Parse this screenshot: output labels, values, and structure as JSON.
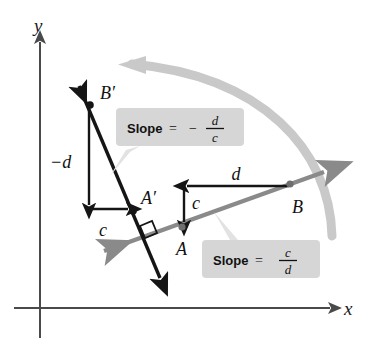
{
  "figure": {
    "background": "#ffffff"
  },
  "colors": {
    "axis": "#4a4a4a",
    "black_line": "#151515",
    "gray_line": "#8a8a8a",
    "rotation_arrow": "#c9c9c9",
    "callout_fill": "#d6d6d6",
    "callout_tail": "#e2e2e2",
    "text": "#111111"
  },
  "axes": {
    "x_label": "x",
    "y_label": "y",
    "origin": {
      "x": 40,
      "y": 308
    }
  },
  "lines": [
    {
      "name": "original-line",
      "color": "#8a8a8a",
      "slope_sign": "positive",
      "from": {
        "x": 100,
        "y": 253
      },
      "to": {
        "x": 327,
        "y": 171
      },
      "arrow_both_ends": true
    },
    {
      "name": "rotated-line",
      "color": "#151515",
      "slope_sign": "negative",
      "from": {
        "x": 77,
        "y": 80
      },
      "to": {
        "x": 162,
        "y": 283
      },
      "arrow_both_ends": true
    }
  ],
  "points": [
    {
      "name": "point-a",
      "label": "A",
      "x": 182,
      "y": 227,
      "label_x": 178,
      "label_y": 253
    },
    {
      "name": "point-b",
      "label": "B",
      "x": 290,
      "y": 184,
      "label_x": 293,
      "label_y": 211
    },
    {
      "name": "point-a-prime",
      "label": "A′",
      "x": 133,
      "y": 211,
      "label_x": 140,
      "label_y": 203
    },
    {
      "name": "point-b-prime",
      "label": "B′",
      "x": 90,
      "y": 105,
      "label_x": 100,
      "label_y": 98
    }
  ],
  "measures": [
    {
      "name": "run-d-original",
      "label": "d",
      "label_x": 240,
      "label_y": 180,
      "direction": "left",
      "from": {
        "x": 289,
        "y": 186
      },
      "to": {
        "x": 185,
        "y": 186
      }
    },
    {
      "name": "rise-c-original",
      "label": "c",
      "label_x": 192,
      "label_y": 207,
      "direction": "down",
      "from": {
        "x": 184,
        "y": 186
      },
      "to": {
        "x": 184,
        "y": 225
      }
    },
    {
      "name": "rise-neg-d-rotated",
      "label": "−d",
      "label_x": 52,
      "label_y": 168,
      "direction": "down",
      "from": {
        "x": 89,
        "y": 107
      },
      "to": {
        "x": 89,
        "y": 208
      }
    },
    {
      "name": "run-c-rotated",
      "label": "c",
      "label_x": 103,
      "label_y": 236,
      "direction": "right",
      "from": {
        "x": 89,
        "y": 209
      },
      "to": {
        "x": 131,
        "y": 209
      }
    }
  ],
  "right_angle_marker": {
    "name": "right-angle-marker",
    "x": 155,
    "y": 225
  },
  "rotation_arrow": {
    "name": "rotation-arrow",
    "description": "counterclockwise sweep from original line to rotated line",
    "color": "#c9c9c9"
  },
  "callouts": [
    {
      "name": "callout-rotated-slope",
      "prefix": "Slope",
      "equals": "=",
      "sign": "−",
      "numerator": "d",
      "denominator": "c",
      "box": {
        "x": 116,
        "y": 108,
        "w": 128,
        "h": 38
      },
      "tail_to": {
        "x": 104,
        "y": 172
      }
    },
    {
      "name": "callout-original-slope",
      "prefix": "Slope",
      "equals": "=",
      "sign": "",
      "numerator": "c",
      "denominator": "d",
      "box": {
        "x": 202,
        "y": 240,
        "w": 118,
        "h": 38
      },
      "tail_to": {
        "x": 214,
        "y": 214
      }
    }
  ]
}
